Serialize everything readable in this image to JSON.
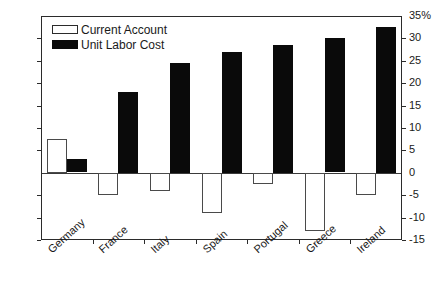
{
  "chart_data": {
    "type": "bar",
    "title": "",
    "xlabel": "",
    "ylabel": "",
    "ylim": [
      -15,
      35
    ],
    "y_ticks": [
      35,
      30,
      25,
      20,
      15,
      10,
      5,
      0,
      -5,
      -10,
      -15
    ],
    "y_tick_labels_left": [
      "35%",
      "30",
      "25",
      "20",
      "15",
      "10",
      "5",
      "0",
      "-5",
      "-10",
      "-15"
    ],
    "y_tick_labels_right": [
      "35%",
      "30",
      "25",
      "20",
      "15",
      "10",
      "5",
      "0",
      "-5",
      "-10",
      "-15"
    ],
    "grid": false,
    "legend_position": "top-left",
    "categories": [
      "Germany",
      "France",
      "Italy",
      "Spain",
      "Portugal",
      "Greece",
      "Ireland"
    ],
    "series": [
      {
        "name": "Current Account",
        "style": "hollow",
        "color": "#ffffff",
        "edge_color": "#4a4a4a",
        "values": [
          7.5,
          -5,
          -4,
          -9,
          -2.5,
          -13,
          -5
        ]
      },
      {
        "name": "Unit Labor Cost",
        "style": "filled",
        "color": "#0a0a0a",
        "edge_color": "#0a0a0a",
        "values": [
          3,
          18,
          24.5,
          27,
          28.5,
          30,
          32.5
        ]
      }
    ]
  }
}
